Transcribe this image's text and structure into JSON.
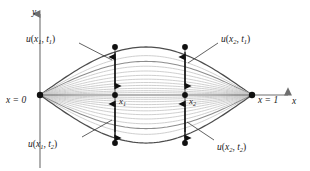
{
  "figure": {
    "axes": {
      "y_label": "y",
      "x_label": "x",
      "origin_label": "x = 0",
      "right_label": "x = 1"
    },
    "tick_labels": [
      {
        "name": "x1",
        "base": "x",
        "sub": "1"
      },
      {
        "name": "x2",
        "base": "x",
        "sub": "2"
      }
    ],
    "annotations": [
      {
        "name": "u-x1-t1",
        "base": "u",
        "arg1": "x",
        "sub1": "1",
        "arg2": "t",
        "sub2": "1"
      },
      {
        "name": "u-x2-t1",
        "base": "u",
        "arg1": "x",
        "sub1": "2",
        "arg2": "t",
        "sub2": "1"
      },
      {
        "name": "u-x1-t2",
        "base": "u",
        "arg1": "x",
        "sub1": "1",
        "arg2": "t",
        "sub2": "2"
      },
      {
        "name": "u-x2-t2",
        "base": "u",
        "arg1": "x",
        "sub1": "2",
        "arg2": "t",
        "sub2": "2"
      }
    ],
    "colors": {
      "axis": "#6e6e6e",
      "curve_dark": "#4d4d4d",
      "curve_mid": "#8c8c8c",
      "curve_light": "#c9c9c9",
      "marker": "#111111",
      "leader": "#3a3a3a",
      "text": "#1a1a1a"
    }
  },
  "chart_data": {
    "type": "line",
    "title": "",
    "xlabel": "x",
    "ylabel": "y",
    "xlim": [
      0,
      1
    ],
    "ylim": [
      -1,
      1
    ],
    "grid": false,
    "legend": "none",
    "x_markers": [
      {
        "label": "x1",
        "x": 0.33
      },
      {
        "label": "x2",
        "x": 0.66
      }
    ],
    "series": [
      {
        "name": "A = 1.00 (upper envelope, t1)",
        "amplitude": 1.0,
        "shade": "dark"
      },
      {
        "name": "A = 0.82",
        "amplitude": 0.82,
        "shade": "light"
      },
      {
        "name": "A = 0.70",
        "amplitude": 0.7,
        "shade": "mid"
      },
      {
        "name": "A = 0.60",
        "amplitude": 0.6,
        "shade": "light"
      },
      {
        "name": "A = 0.50",
        "amplitude": 0.5,
        "shade": "light"
      },
      {
        "name": "A = 0.41",
        "amplitude": 0.41,
        "shade": "light"
      },
      {
        "name": "A = 0.33",
        "amplitude": 0.33,
        "shade": "light"
      },
      {
        "name": "A = 0.26",
        "amplitude": 0.26,
        "shade": "light"
      },
      {
        "name": "A = 0.20",
        "amplitude": 0.2,
        "shade": "light"
      },
      {
        "name": "A = 0.14",
        "amplitude": 0.14,
        "shade": "light"
      },
      {
        "name": "A = 0.09",
        "amplitude": 0.09,
        "shade": "light"
      },
      {
        "name": "A = 0.05",
        "amplitude": 0.05,
        "shade": "light"
      },
      {
        "name": "A = -0.05",
        "amplitude": -0.05,
        "shade": "light"
      },
      {
        "name": "A = -0.09",
        "amplitude": -0.09,
        "shade": "light"
      },
      {
        "name": "A = -0.14",
        "amplitude": -0.14,
        "shade": "light"
      },
      {
        "name": "A = -0.20",
        "amplitude": -0.2,
        "shade": "light"
      },
      {
        "name": "A = -0.26",
        "amplitude": -0.26,
        "shade": "light"
      },
      {
        "name": "A = -0.33",
        "amplitude": -0.33,
        "shade": "light"
      },
      {
        "name": "A = -0.41",
        "amplitude": -0.41,
        "shade": "light"
      },
      {
        "name": "A = -0.50",
        "amplitude": -0.5,
        "shade": "light"
      },
      {
        "name": "A = -0.60",
        "amplitude": -0.6,
        "shade": "light"
      },
      {
        "name": "A = -0.70",
        "amplitude": -0.7,
        "shade": "mid"
      },
      {
        "name": "A = -0.82",
        "amplitude": -0.82,
        "shade": "light"
      },
      {
        "name": "A = -1.00 (lower envelope, t2)",
        "amplitude": -1.0,
        "shade": "dark"
      }
    ],
    "marked_points": [
      {
        "name": "u-x1-t1",
        "x": 0.33,
        "y": 1.0
      },
      {
        "name": "u-x2-t1",
        "x": 0.66,
        "y": 1.0
      },
      {
        "name": "u-x1-origin",
        "x": 0.33,
        "y": 0.0
      },
      {
        "name": "u-x2-origin",
        "x": 0.66,
        "y": 0.0
      },
      {
        "name": "u-x1-t2",
        "x": 0.33,
        "y": -1.0
      },
      {
        "name": "u-x2-t2",
        "x": 0.66,
        "y": -1.0
      },
      {
        "name": "endpoint-left",
        "x": 0.0,
        "y": 0.0
      },
      {
        "name": "endpoint-right",
        "x": 1.0,
        "y": 0.0
      }
    ]
  }
}
